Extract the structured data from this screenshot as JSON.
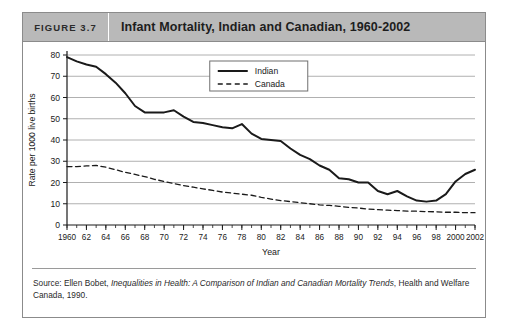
{
  "figure": {
    "number_label": "FIGURE 3.7",
    "title": "Infant Mortality, Indian and Canadian, 1960-2002"
  },
  "source": {
    "prefix": "Source: Ellen Bobet, ",
    "italic_title": "Inequalities in Health: A Comparison of Indian and Canadian Mortality Trends",
    "suffix": ", Health and Welfare Canada, 1990."
  },
  "colors": {
    "header_background": "#b9b9b9",
    "frame_border": "#8b8b8b",
    "gridline": "#b0b0b0",
    "indian_line": "#1a1a1a",
    "canada_line": "#1a1a1a",
    "text": "#1a1a1a"
  },
  "chart_data": {
    "type": "line",
    "title": "Infant Mortality, Indian and Canadian, 1960-2002",
    "xlabel": "Year",
    "ylabel": "Rate per 1000 live births",
    "xlim": [
      1960,
      2002
    ],
    "ylim": [
      0,
      80
    ],
    "grid": true,
    "grid_axis": "y",
    "legend_position": "top-center",
    "y_ticks": [
      0,
      10,
      20,
      30,
      40,
      50,
      60,
      70,
      80
    ],
    "y_tick_labels": [
      "0",
      "10",
      "20",
      "30",
      "40",
      "50",
      "60",
      "70",
      "80"
    ],
    "x_ticks": [
      1960,
      1962,
      1964,
      1966,
      1968,
      1970,
      1972,
      1974,
      1976,
      1978,
      1980,
      1982,
      1984,
      1986,
      1988,
      1990,
      1992,
      1994,
      1996,
      1998,
      2000,
      2002
    ],
    "x_tick_labels": [
      "1960",
      "62",
      "64",
      "66",
      "68",
      "70",
      "72",
      "74",
      "76",
      "78",
      "80",
      "82",
      "84",
      "86",
      "88",
      "90",
      "92",
      "94",
      "96",
      "98",
      "2000",
      "2002"
    ],
    "x_minor_tick_interval": 1,
    "x": [
      1960,
      1961,
      1962,
      1963,
      1964,
      1965,
      1966,
      1967,
      1968,
      1969,
      1970,
      1971,
      1972,
      1973,
      1974,
      1975,
      1976,
      1977,
      1978,
      1979,
      1980,
      1981,
      1982,
      1983,
      1984,
      1985,
      1986,
      1987,
      1988,
      1989,
      1990,
      1991,
      1992,
      1993,
      1994,
      1995,
      1996,
      1997,
      1998,
      1999,
      2000,
      2001,
      2002
    ],
    "series": [
      {
        "name": "Indian",
        "style": "solid",
        "line_width": 2,
        "values": [
          79,
          77,
          75.5,
          74.5,
          71,
          67,
          62,
          56,
          53,
          53,
          53,
          54,
          51,
          48.5,
          48,
          47,
          46,
          45.5,
          47.5,
          43,
          40.5,
          40,
          39.5,
          36,
          33,
          31,
          28,
          26,
          22,
          21.5,
          20,
          20,
          16,
          14.5,
          16,
          13.5,
          11.5,
          11,
          11.5,
          14.5,
          20.5,
          24,
          26
        ]
      },
      {
        "name": "Canada",
        "style": "dashed",
        "line_width": 1.3,
        "values": [
          27.5,
          27.5,
          27.8,
          28,
          27.2,
          26,
          24.8,
          23.8,
          22.8,
          21.5,
          20.5,
          19.5,
          18.5,
          17.8,
          17,
          16.3,
          15.5,
          15,
          14.5,
          14,
          13,
          12.2,
          11.5,
          11,
          10.5,
          10,
          9.5,
          9.2,
          8.8,
          8.3,
          8,
          7.5,
          7.2,
          7,
          6.8,
          6.5,
          6.5,
          6.3,
          6.2,
          6,
          6,
          5.8,
          5.8
        ]
      }
    ],
    "series_display_note": "Indian series plotted left-to-right as drawn in figure; peak of 26 occurs near 1992 with decline to about 8 by 1999.",
    "indian_plotted_values": [
      79,
      77,
      75.5,
      74.5,
      71,
      67,
      62,
      56,
      53,
      53,
      53,
      54,
      51,
      48.5,
      48,
      47,
      46,
      45.5,
      47.5,
      43,
      40.5,
      40,
      39.5,
      36,
      33,
      31,
      28,
      26,
      22,
      21.5,
      20,
      20,
      16,
      14.5,
      16,
      13.5,
      11.5,
      11,
      11.5,
      14.5,
      20.5,
      24,
      26
    ],
    "legend": [
      {
        "label": "Indian",
        "style": "solid"
      },
      {
        "label": "Canada",
        "style": "dashed"
      }
    ]
  }
}
